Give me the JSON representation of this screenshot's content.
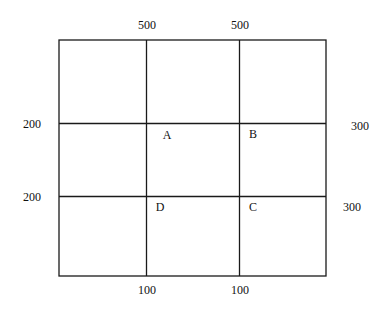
{
  "diagram": {
    "type": "road-grid",
    "colors": {
      "line": "#1a1a1a",
      "text": "#111111",
      "background": "#ffffff"
    },
    "top_labels": [
      {
        "id": "top-left",
        "text": "500"
      },
      {
        "id": "top-right",
        "text": "500"
      }
    ],
    "bottom_labels": [
      {
        "id": "bottom-left",
        "text": "100"
      },
      {
        "id": "bottom-right",
        "text": "100"
      }
    ],
    "left_labels": [
      {
        "id": "left-upper",
        "text": "200"
      },
      {
        "id": "left-lower",
        "text": "200"
      }
    ],
    "right_labels": [
      {
        "id": "right-upper",
        "text": "300"
      },
      {
        "id": "right-lower",
        "text": "300"
      }
    ],
    "nodes": [
      {
        "id": "A",
        "text": "A"
      },
      {
        "id": "B",
        "text": "B"
      },
      {
        "id": "C",
        "text": "C"
      },
      {
        "id": "D",
        "text": "D"
      }
    ]
  }
}
